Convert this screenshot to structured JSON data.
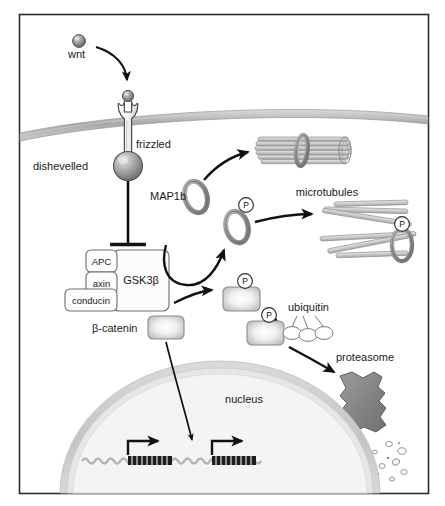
{
  "figure": {
    "width": 445,
    "height": 506,
    "background_color": "#ffffff",
    "frame_color": "#2b2b2b"
  },
  "labels": {
    "wnt": "wnt",
    "frizzled": "frizzled",
    "dishevelled": "dishevelled",
    "map1b": "MAP1b",
    "microtubules": "microtubules",
    "gsk3b": "GSK3β",
    "apc": "APC",
    "axin": "axin",
    "conducin": "conducin",
    "beta_catenin": "β-catenin",
    "ubiquitin": "ubiquitin",
    "proteasome": "proteasome",
    "nucleus": "nucleus",
    "phosphate": "P"
  },
  "components": {
    "ligand": {
      "name": "wnt",
      "shape": "sphere",
      "color": "#8a8a8a"
    },
    "receptor": {
      "name": "frizzled",
      "shape": "wrench-receptor",
      "color": "#f2f2f2",
      "stroke": "#4d4d4d"
    },
    "adaptor": {
      "name": "dishevelled",
      "shape": "sphere",
      "color": "#9e9e9e"
    },
    "membrane": {
      "name": "plasma-membrane",
      "color": "#b8b8b8",
      "shape": "curved-band"
    },
    "kinase_complex": {
      "primary": "GSK3β",
      "partners": [
        "APC",
        "axin",
        "conducin"
      ],
      "box_fill": "#fcfcfc",
      "box_stroke": "#6b6b6b"
    },
    "substrate": {
      "name": "β-catenin",
      "shape": "rounded-box",
      "fill_center": "#ffffff",
      "fill_edge": "#c2c2c2"
    },
    "map_protein": {
      "name": "MAP1b",
      "shape": "ring",
      "color": "#9a9a9a"
    },
    "nucleus": {
      "name": "nucleus",
      "shape": "dome",
      "envelope_color": "#cfcfcf",
      "interior_color": "#f4f4f4"
    },
    "dna": {
      "shape": "double-helix-strand",
      "gene_count": 2,
      "color": "#b5b5b5",
      "gene_color": "#1c1c1c"
    },
    "proteasome": {
      "name": "proteasome",
      "shape": "barrel-blob",
      "color": "#8f8f8f"
    },
    "degradation_products": {
      "count": 12,
      "shape": "small-ovals",
      "color": "#9a9a9a"
    },
    "ubiquitin_chain": {
      "count": 3,
      "shape": "ovals",
      "color": "#ffffff",
      "stroke": "#6e6e6e"
    },
    "microtubule_bundle": {
      "shape": "parallel-tubes-with-ring",
      "count": 7,
      "color": "#d2d2d2"
    },
    "microtubules_scattered": {
      "shape": "scattered-tubes",
      "count": 6,
      "color": "#c9c9c9"
    }
  },
  "interactions": [
    {
      "from": "wnt",
      "to": "frizzled",
      "type": "activation-arrow"
    },
    {
      "from": "dishevelled",
      "to": "GSK3β-complex",
      "type": "inhibition-bar"
    },
    {
      "from": "MAP1b",
      "to": "microtubule-bundle",
      "type": "activation-arrow"
    },
    {
      "from": "GSK3β-complex",
      "to": "MAP1b-phospho",
      "type": "phosphorylation-arrow"
    },
    {
      "from": "MAP1b-phospho",
      "to": "microtubules-scattered",
      "type": "activation-arrow"
    },
    {
      "from": "GSK3β-complex",
      "to": "β-catenin-phospho",
      "type": "phosphorylation-arrow"
    },
    {
      "from": "β-catenin-phospho",
      "to": "β-catenin-ubiquitinated",
      "type": "activation-arrow"
    },
    {
      "from": "β-catenin-ubiquitinated",
      "to": "proteasome",
      "type": "degradation-arrow"
    },
    {
      "from": "β-catenin",
      "to": "nucleus-dna",
      "type": "translocation-arrow"
    }
  ]
}
